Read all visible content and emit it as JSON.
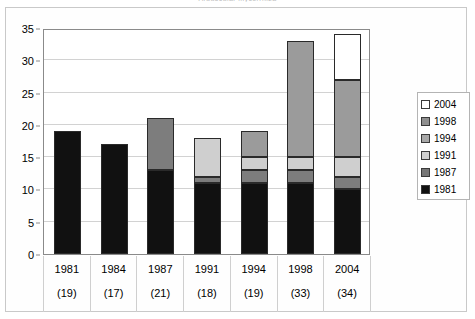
{
  "chart_data": {
    "type": "bar",
    "subtype": "stacked-bar",
    "title": "Arbuscular mycorrhiza",
    "categories": [
      "1981",
      "1984",
      "1987",
      "1991",
      "1994",
      "1998",
      "2004"
    ],
    "category_sublabels": [
      "(19)",
      "(17)",
      "(21)",
      "(18)",
      "(19)",
      "(33)",
      "(34)"
    ],
    "totals": [
      19,
      17,
      21,
      18,
      19,
      33,
      34
    ],
    "series": [
      {
        "name": "1981",
        "color": "#111111",
        "values": [
          19,
          17,
          13,
          11,
          11,
          11,
          10
        ]
      },
      {
        "name": "1987",
        "color": "#7d7d7d",
        "values": [
          0,
          0,
          8,
          1,
          2,
          2,
          2
        ]
      },
      {
        "name": "1991",
        "color": "#cfcfcf",
        "values": [
          0,
          0,
          0,
          6,
          2,
          2,
          3
        ]
      },
      {
        "name": "1994",
        "color": "#9b9b9b",
        "values": [
          0,
          0,
          0,
          0,
          4,
          0,
          12
        ]
      },
      {
        "name": "1998",
        "color": "#9b9b9b",
        "values": [
          0,
          0,
          0,
          0,
          0,
          18,
          0
        ]
      },
      {
        "name": "2004",
        "color": "#ffffff",
        "values": [
          0,
          0,
          0,
          0,
          0,
          0,
          7
        ]
      }
    ],
    "xlabel": "",
    "ylabel": "",
    "ylim": [
      0,
      35
    ],
    "yticks": [
      0,
      5,
      10,
      15,
      20,
      25,
      30,
      35
    ],
    "grid": true,
    "legend_position": "right",
    "legend_entries": [
      {
        "label": "2004",
        "color": "#ffffff"
      },
      {
        "label": "1998",
        "color": "#8f8f8f"
      },
      {
        "label": "1994",
        "color": "#a8a8a8"
      },
      {
        "label": "1991",
        "color": "#cfcfcf"
      },
      {
        "label": "1987",
        "color": "#767676"
      },
      {
        "label": "1981",
        "color": "#111111"
      }
    ]
  }
}
